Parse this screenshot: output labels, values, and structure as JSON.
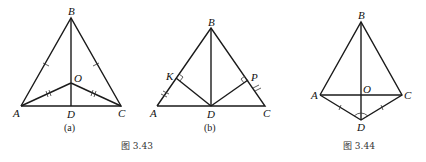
{
  "figures": {
    "fig_a": {
      "sublabel": "(a)",
      "points": {
        "A": "A",
        "B": "B",
        "C": "C",
        "D": "D",
        "O": "O"
      }
    },
    "fig_b": {
      "sublabel": "(b)",
      "points": {
        "A": "A",
        "B": "B",
        "C": "C",
        "D": "D",
        "K": "K",
        "P": "P"
      }
    },
    "fig_344": {
      "points": {
        "A": "A",
        "B": "B",
        "C": "C",
        "D": "D",
        "O": "O"
      }
    }
  },
  "captions": {
    "fig_343": "图 3.43",
    "fig_344": "图 3.44"
  }
}
